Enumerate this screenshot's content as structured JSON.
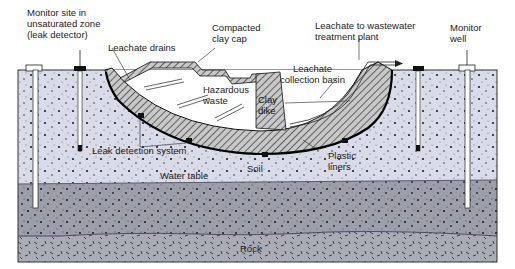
{
  "diagram": {
    "type": "cross-section",
    "labels": {
      "monitor_site": "Monitor site in\nunsaturated zone\n(leak detector)",
      "leachate_drains": "Leachate drains",
      "clay_cap": "Compacted\nclay cap",
      "leachate_to_plant": "Leachate to wastewater\ntreatment plant",
      "monitor_well": "Monitor\nwell",
      "leachate_basin": "Leachate\ncollection basin",
      "hazardous_waste": "Hazardous\nwaste",
      "clay_dike": "Clay\ndike",
      "leak_detection": "Leak detection system",
      "plastic_liners": "Plastic\nliners",
      "soil": "Soil",
      "water_table": "Water table",
      "rock": "Rock"
    },
    "colors": {
      "soil": "#d9dce8",
      "saturated": "#9c9ea9",
      "rock": "#a9abb5",
      "clay_hatch": "#7a7a7a",
      "outline": "#1a1a1a",
      "water_table_line": "#5a5a7a"
    }
  }
}
